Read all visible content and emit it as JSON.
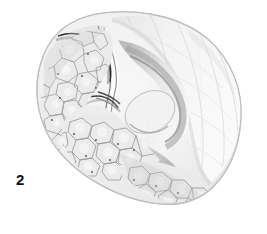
{
  "figure": {
    "number_label": "2",
    "caption": "",
    "technique": "grayscale-stipple-line-drawing",
    "background_color": "#ffffff",
    "ink_color": "#3a3a3a",
    "shadow_color": "#9a9a9a",
    "highlight_color": "#f4f4f4",
    "outline_color": "#c9c9c9",
    "dark_ridge_color": "#2b2b2b"
  },
  "specimen": {
    "name": "valve-specimen",
    "outline_name": "specimen-outline",
    "regions": [
      {
        "name": "upper-fan-region",
        "description": "smooth radially ribbed fan sector, upper right",
        "fill": "#f6f6f6"
      },
      {
        "name": "tubercle-field-left",
        "description": "polygonal tubercle / cell mosaic, left flank",
        "fill": "#eeeeee"
      },
      {
        "name": "tubercle-field-lower",
        "description": "polygonal tubercle / cell mosaic, lower right margin",
        "fill": "#ededed"
      },
      {
        "name": "central-furrow",
        "description": "deep sigmoid furrow with paired crests across the middle",
        "fill": "#e3e3e3"
      },
      {
        "name": "dark-marginal-ridge",
        "description": "narrow dark curved ridge line from upper-left to lower-right margin",
        "fill": "#2b2b2b"
      }
    ]
  }
}
